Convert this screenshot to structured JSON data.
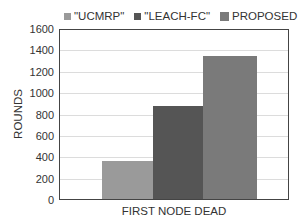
{
  "chart_data": {
    "type": "bar",
    "title": "",
    "categories": [
      "FIRST NODE DEAD"
    ],
    "series": [
      {
        "name": "\"UCMRP\"",
        "values": [
          360
        ],
        "color": "#9a9a9a"
      },
      {
        "name": "\"LEACH-FC\"",
        "values": [
          880
        ],
        "color": "#555555"
      },
      {
        "name": "PROPOSED",
        "values": [
          1350
        ],
        "color": "#7a7a7a"
      }
    ],
    "xlabel": "FIRST NODE DEAD",
    "ylabel": "ROUNDS",
    "ylim": [
      0,
      1600
    ],
    "yticks": [
      "1600",
      "1400",
      "1200",
      "1000",
      "800",
      "600",
      "400",
      "200",
      "0"
    ],
    "grid": true,
    "legend_position": "top"
  }
}
